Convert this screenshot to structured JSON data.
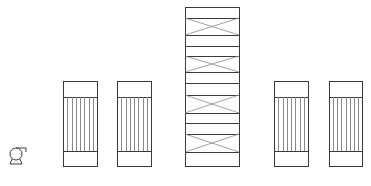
{
  "diagram": {
    "type": "process-equipment-schematic",
    "colors": {
      "line": "#3a3a3a",
      "tube_line": "#8a8a8a",
      "background": "#ffffff"
    },
    "equipment": [
      {
        "id": "pump",
        "kind": "pump",
        "cx": 16,
        "cy": 154,
        "r": 6
      },
      {
        "id": "hx1",
        "kind": "shell-and-tube-exchanger",
        "x": 63,
        "y": 81,
        "w": 34,
        "h": 85,
        "tube_top": 97,
        "tube_bottom": 151,
        "tube_count": 7
      },
      {
        "id": "hx2",
        "kind": "shell-and-tube-exchanger",
        "x": 117,
        "y": 81,
        "w": 34,
        "h": 85,
        "tube_top": 97,
        "tube_bottom": 151,
        "tube_count": 7
      },
      {
        "id": "column",
        "kind": "packed-column",
        "x": 185,
        "y": 7,
        "w": 54,
        "h": 159,
        "packed_sections": [
          [
            18,
            35
          ],
          [
            56,
            72
          ],
          [
            95,
            113
          ],
          [
            134,
            152
          ]
        ],
        "dividers": [
          18,
          35,
          46,
          56,
          72,
          83,
          95,
          113,
          123,
          134,
          152
        ]
      },
      {
        "id": "hx3",
        "kind": "shell-and-tube-exchanger",
        "x": 274,
        "y": 81,
        "w": 34,
        "h": 85,
        "tube_top": 97,
        "tube_bottom": 151,
        "tube_count": 7
      },
      {
        "id": "hx4",
        "kind": "shell-and-tube-exchanger",
        "x": 329,
        "y": 81,
        "w": 33,
        "h": 85,
        "tube_top": 97,
        "tube_bottom": 151,
        "tube_count": 7
      }
    ]
  }
}
